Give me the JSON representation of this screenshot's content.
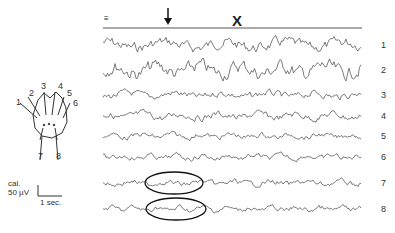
{
  "figure": {
    "type": "EEG recording with electrode montage",
    "top_marker_left": "≡",
    "arrow_marker": "↓",
    "x_marker": "X",
    "channels": [
      {
        "label": "1",
        "y": 45,
        "amp": 6,
        "freq": 0.35
      },
      {
        "label": "2",
        "y": 70,
        "amp": 8,
        "freq": 0.5
      },
      {
        "label": "3",
        "y": 95,
        "amp": 4,
        "freq": 0.45
      },
      {
        "label": "4",
        "y": 116,
        "amp": 4,
        "freq": 0.55
      },
      {
        "label": "5",
        "y": 136,
        "amp": 3,
        "freq": 0.7
      },
      {
        "label": "6",
        "y": 157,
        "amp": 3,
        "freq": 0.8
      },
      {
        "label": "7",
        "y": 183,
        "amp": 3,
        "freq": 0.6
      },
      {
        "label": "8",
        "y": 209,
        "amp": 3,
        "freq": 0.9
      }
    ],
    "highlighted_segments": [
      {
        "channel": "7",
        "cx": 174,
        "cy": 183,
        "rx": 29,
        "ry": 11
      },
      {
        "channel": "8",
        "cx": 176,
        "cy": 209,
        "rx": 30,
        "ry": 11
      }
    ],
    "head_diagram": {
      "electrode_labels": [
        "1",
        "2",
        "3",
        "4",
        "5",
        "6",
        "7",
        "8"
      ]
    },
    "calibration": {
      "label": "cal.",
      "amplitude": "50 µV",
      "time": "1 sec."
    }
  }
}
